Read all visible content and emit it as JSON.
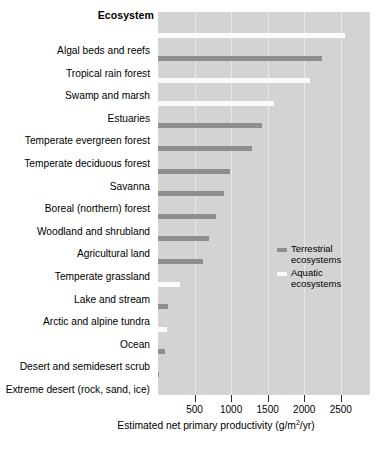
{
  "chart_data": {
    "type": "bar",
    "orientation": "horizontal",
    "title": "Ecosystem",
    "xlabel": "Estimated net primary productivity (g/m2/yr)",
    "xlabel_parts": {
      "prefix": "Estimated net primary productivity (g/m",
      "exponent": "2",
      "suffix": "/yr)"
    },
    "ylabel": "",
    "xlim": [
      0,
      2900
    ],
    "xticks": [
      500,
      1000,
      1500,
      2000,
      2500
    ],
    "xtick_labels": [
      "500",
      "1000",
      "1500",
      "2000",
      "2500"
    ],
    "grid": "vertical",
    "legend_position": "inside-right-middle",
    "categories": [
      "Algal beds and reefs",
      "Tropical rain forest",
      "Swamp and marsh",
      "Estuaries",
      "Temperate evergreen forest",
      "Temperate deciduous forest",
      "Savanna",
      "Boreal (northern) forest",
      "Woodland and shrubland",
      "Agricultural land",
      "Temperate grassland",
      "Lake and stream",
      "Arctic and alpine tundra",
      "Ocean",
      "Desert and semidesert scrub",
      "Extreme desert (rock, sand, ice)"
    ],
    "values": [
      2560,
      2250,
      2080,
      1580,
      1420,
      1290,
      980,
      900,
      800,
      700,
      620,
      300,
      140,
      125,
      90,
      3
    ],
    "groups": [
      "aquatic",
      "terrestrial",
      "aquatic",
      "aquatic",
      "terrestrial",
      "terrestrial",
      "terrestrial",
      "terrestrial",
      "terrestrial",
      "terrestrial",
      "terrestrial",
      "aquatic",
      "terrestrial",
      "aquatic",
      "terrestrial",
      "terrestrial"
    ],
    "series": [
      {
        "name": "Terrestrial ecosystems",
        "color": "#8e8e8e"
      },
      {
        "name": "Aquatic ecosystems",
        "color": "#fbfbfb"
      }
    ]
  },
  "legend": {
    "terrestrial_label": "Terrestrial\necosystems",
    "aquatic_label": "Aquatic\necosystems"
  },
  "colors": {
    "plot_background": "#d3d3d3",
    "gridline": "#e8e8e8",
    "terrestrial_bar": "#8e8e8e",
    "aquatic_bar": "#fbfbfb",
    "text": "#000000"
  }
}
